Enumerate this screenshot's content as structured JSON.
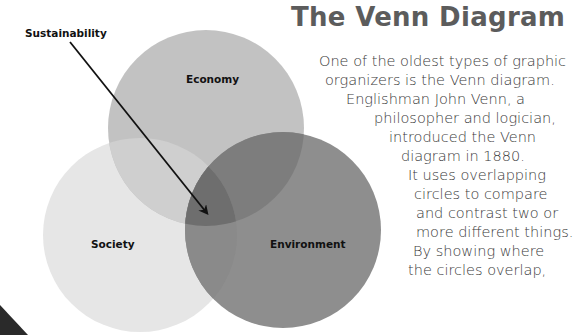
{
  "title": "The Venn Diagram",
  "diagram": {
    "pointer_label": "Sustainability",
    "circles": [
      {
        "name": "Economy",
        "cx": 206,
        "cy": 128,
        "r": 98,
        "fill": "#bcbcbc"
      },
      {
        "name": "Society",
        "cx": 140,
        "cy": 235,
        "r": 97,
        "fill": "#e6e6e6"
      },
      {
        "name": "Environment",
        "cx": 283,
        "cy": 230,
        "r": 98,
        "fill": "#8c8c8c"
      }
    ],
    "labels": {
      "economy": "Economy",
      "society": "Society",
      "environment": "Environment"
    },
    "overlap_fill": "#6e6e6e"
  },
  "body_lines": [
    "One of the oldest types of graphic",
    "organizers is the Venn diagram.",
    "Englishman John Venn, a",
    "philosopher and logician,",
    "introduced the Venn",
    "diagram in 1880.",
    "It uses overlapping",
    "circles to compare",
    "and contrast two or",
    "more different things.",
    "By showing where",
    "the circles overlap,"
  ]
}
